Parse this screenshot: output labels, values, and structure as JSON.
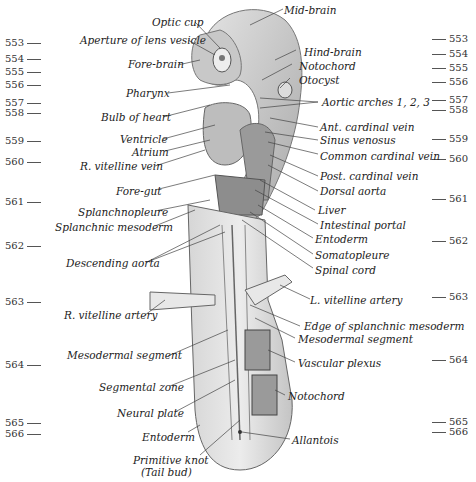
{
  "figure": {
    "type": "anatomical illustration of early embryo (dorsal/lateral view)",
    "left_numbers": [
      {
        "n": "553",
        "y": 40
      },
      {
        "n": "554",
        "y": 56
      },
      {
        "n": "555",
        "y": 69
      },
      {
        "n": "556",
        "y": 82
      },
      {
        "n": "557",
        "y": 99
      },
      {
        "n": "558",
        "y": 110
      },
      {
        "n": "559",
        "y": 138
      },
      {
        "n": "560",
        "y": 159
      },
      {
        "n": "561",
        "y": 199
      },
      {
        "n": "562",
        "y": 243
      },
      {
        "n": "563",
        "y": 299
      },
      {
        "n": "564",
        "y": 362
      },
      {
        "n": "565",
        "y": 420
      },
      {
        "n": "566",
        "y": 431
      }
    ],
    "right_numbers": [
      {
        "n": "553",
        "y": 36
      },
      {
        "n": "554",
        "y": 51
      },
      {
        "n": "555",
        "y": 65
      },
      {
        "n": "556",
        "y": 79
      },
      {
        "n": "557",
        "y": 97
      },
      {
        "n": "558",
        "y": 107
      },
      {
        "n": "559",
        "y": 136
      },
      {
        "n": "560",
        "y": 156
      },
      {
        "n": "561",
        "y": 196
      },
      {
        "n": "562",
        "y": 238
      },
      {
        "n": "563",
        "y": 294
      },
      {
        "n": "564",
        "y": 357
      },
      {
        "n": "565",
        "y": 419
      },
      {
        "n": "566",
        "y": 429
      }
    ],
    "labels": {
      "mid_brain": "Mid-brain",
      "optic_cup": "Optic cup",
      "aperture_lens_vesicle": "Aperture of lens vesicle",
      "hind_brain": "Hind-brain",
      "fore_brain": "Fore-brain",
      "notochord_top": "Notochord",
      "otocyst": "Otocyst",
      "pharynx": "Pharynx",
      "aortic_arches": "Aortic arches 1, 2, 3",
      "bulb_of_heart": "Bulb of heart",
      "ant_cardinal_vein": "Ant. cardinal vein",
      "ventricle": "Ventricle",
      "sinus_venosus": "Sinus venosus",
      "atrium": "Atrium",
      "common_cardinal_vein": "Common cardinal vein",
      "r_vitelline_vein": "R. vitelline vein",
      "post_cardinal_vein": "Post. cardinal vein",
      "dorsal_aorta": "Dorsal aorta",
      "fore_gut": "Fore-gut",
      "liver": "Liver",
      "splanchnopleure": "Splanchnopleure",
      "intestinal_portal": "Intestinal portal",
      "splanchnic_mesoderm": "Splanchnic mesoderm",
      "entoderm_top": "Entoderm",
      "somatopleure": "Somatopleure",
      "descending_aorta": "Descending aorta",
      "spinal_cord": "Spinal cord",
      "r_vitelline_artery": "R. vitelline artery",
      "l_vitelline_artery": "L. vitelline artery",
      "edge_splanchnic_mesoderm": "Edge of splanchnic mesoderm",
      "mesodermal_segment_r": "Mesodermal segment",
      "mesodermal_segment_l": "Mesodermal segment",
      "vascular_plexus": "Vascular plexus",
      "segmental_zone": "Segmental zone",
      "notochord_bottom": "Notochord",
      "neural_plate": "Neural plate",
      "entoderm_bottom": "Entoderm",
      "allantois": "Allantois",
      "primitive_knot": "Primitive knot",
      "tail_bud": "(Tail bud)"
    }
  }
}
